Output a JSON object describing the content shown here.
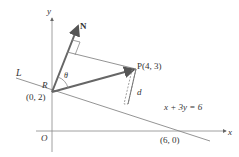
{
  "diagram": {
    "axes": {
      "x_label": "x",
      "y_label": "y",
      "origin_label": "O"
    },
    "line": {
      "label": "L",
      "equation": "x + 3y = 6"
    },
    "points": {
      "R": {
        "name": "R",
        "coords": "(0, 2)"
      },
      "P": {
        "label": "P(4, 3)"
      },
      "x_intercept": {
        "coords": "(6, 0)"
      }
    },
    "normal_vector": {
      "label": "N"
    },
    "angle": {
      "label": "θ"
    },
    "distance": {
      "label": "d"
    },
    "colors": {
      "axis": "#777777",
      "vector": "#666666",
      "line": "#777777",
      "text": "#333333"
    }
  }
}
